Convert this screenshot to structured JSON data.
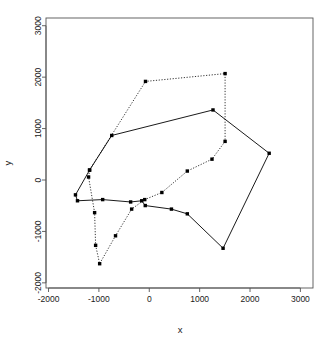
{
  "chart_data": {
    "type": "scatter",
    "title": "",
    "xlabel": "x",
    "ylabel": "y",
    "xlim": [
      -2050,
      3250
    ],
    "ylim": [
      -2100,
      3150
    ],
    "xticks": [
      -2000,
      -1000,
      0,
      1000,
      2000,
      3000
    ],
    "yticks": [
      -2000,
      -1000,
      0,
      1000,
      2000,
      3000
    ],
    "xtick_labels": [
      "-2000",
      "-1000",
      "0",
      "1000",
      "2000",
      "3000"
    ],
    "ytick_labels": [
      "-2000",
      "-1000",
      "0",
      "1000",
      "2000",
      "3000"
    ],
    "grid": false,
    "legend": null,
    "frame": true,
    "point_marker": "filled-square",
    "point_color": "#000000",
    "series": [
      {
        "name": "solid-path",
        "style": "solid",
        "color": "#000000",
        "closed": true,
        "points": [
          [
            -1465,
            -289
          ],
          [
            -1425,
            -404
          ],
          [
            -925,
            -381
          ],
          [
            -370,
            -427
          ],
          [
            -150,
            -404
          ],
          [
            -80,
            -497
          ],
          [
            440,
            -566
          ],
          [
            755,
            -658
          ],
          [
            1465,
            -1327
          ],
          [
            2380,
            520
          ],
          [
            1265,
            1362
          ],
          [
            -745,
            866
          ],
          [
            -1185,
            193
          ]
        ]
      },
      {
        "name": "dotted-path",
        "style": "dotted",
        "color": "#000000",
        "closed": true,
        "points": [
          [
            -1185,
            193
          ],
          [
            -1205,
            58
          ],
          [
            -1085,
            -635
          ],
          [
            -1065,
            -1270
          ],
          [
            -985,
            -1628
          ],
          [
            -670,
            -1085
          ],
          [
            -350,
            -566
          ],
          [
            -90,
            -381
          ],
          [
            250,
            -243
          ],
          [
            755,
            174
          ],
          [
            1245,
            405
          ],
          [
            1505,
            751
          ],
          [
            1505,
            2069
          ],
          [
            -75,
            1917
          ]
        ]
      }
    ]
  },
  "axes": {
    "x_title": "x",
    "y_title": "y"
  }
}
